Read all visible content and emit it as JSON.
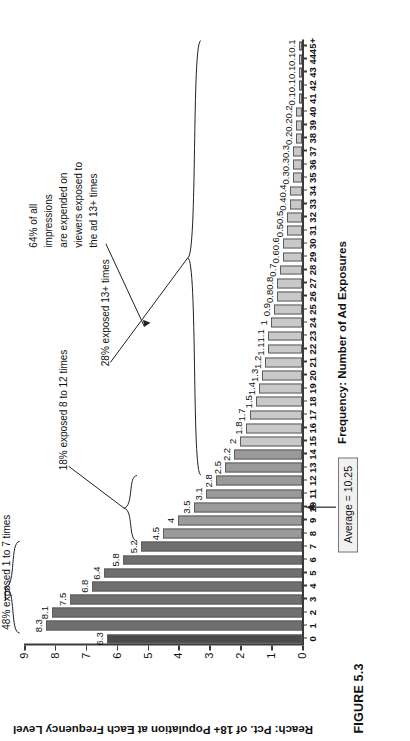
{
  "figure": {
    "caption": "FIGURE 5.3"
  },
  "chart_data": {
    "type": "bar",
    "title": "",
    "xlabel": "Frequency: Number of Ad Exposures",
    "ylabel": "Reach: Pct. of 18+ Population at Each Frequency Level",
    "ylim": [
      0,
      9
    ],
    "yticks": [
      0,
      1,
      2,
      3,
      4,
      5,
      6,
      7,
      8,
      9
    ],
    "grid": false,
    "legend": "none",
    "categories": [
      "0",
      "1",
      "2",
      "3",
      "4",
      "5",
      "6",
      "7",
      "8",
      "9",
      "10",
      "11",
      "12",
      "13",
      "14",
      "15",
      "16",
      "17",
      "18",
      "19",
      "20",
      "21",
      "22",
      "23",
      "24",
      "25",
      "26",
      "27",
      "28",
      "29",
      "30",
      "31",
      "32",
      "33",
      "34",
      "35",
      "36",
      "37",
      "38",
      "39",
      "40",
      "41",
      "42",
      "43",
      "44",
      "45+"
    ],
    "values": [
      6.3,
      8.3,
      8.1,
      7.5,
      6.8,
      6.4,
      5.8,
      5.2,
      4.5,
      4,
      3.5,
      3.1,
      2.8,
      2.5,
      2.2,
      2,
      1.8,
      1.7,
      1.5,
      1.4,
      1.3,
      1.2,
      1.1,
      1.1,
      1,
      0.9,
      0.8,
      0.8,
      0.7,
      0.6,
      0.6,
      0.5,
      0.5,
      0.4,
      0.4,
      0.3,
      0.3,
      0.3,
      0.2,
      0.2,
      0.2,
      0.1,
      0.1,
      0.1,
      0.1,
      0.1
    ],
    "value_labels": [
      "6.3",
      "8.3",
      "8.1",
      "7.5",
      "6.8",
      "6.4",
      "5.8",
      "5.2",
      "4.5",
      "4",
      "3.5",
      "3.1",
      "2.8",
      "2.5",
      "2.2",
      "2",
      "1.8",
      "1.7",
      "1.5",
      "1.4",
      "1.3",
      "1.2",
      "1.1",
      "1.1",
      "1",
      "0.9",
      "0.8",
      "0.8",
      "0.7",
      "0.6",
      "0.6",
      "0.5",
      "0.5",
      "0.4",
      "0.4",
      "0.3",
      "0.3",
      "0.3",
      "0.2",
      "0.2",
      "0.2",
      "0.1",
      "0.1",
      "0.1",
      "0.1",
      "0.1"
    ]
  },
  "annotations": {
    "average_label": "Average = 10.25",
    "brace_1_to_7": "48% exposed 1 to 7 times",
    "brace_8_to_12": "18% exposed 8 to 12 times",
    "brace_13_plus": "28% exposed 13+ times",
    "callout_impressions": "64% of all\nimpressions\nare expended on\nviewers exposed to\nthe ad 13+ times"
  },
  "colors": {
    "bar_dark": "#6f6f6f",
    "bar_mid": "#9a9a9a",
    "bar_light": "#c9c9c9",
    "bar_first": "#4a4a4a",
    "axis": "#3a3a3a",
    "avg_box_bg": "#f1f1f1"
  }
}
